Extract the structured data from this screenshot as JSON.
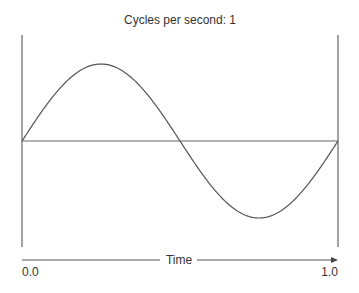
{
  "title": "Cycles per second: 1",
  "axis": {
    "label": "Time",
    "start_label": "0.0",
    "end_label": "1.0"
  },
  "chart_data": {
    "type": "line",
    "title": "Cycles per second: 1",
    "xlabel": "Time",
    "ylabel": "",
    "xlim": [
      0.0,
      1.0
    ],
    "ylim": [
      -1,
      1
    ],
    "cycles_per_second": 1,
    "waveform": "sine",
    "x_tick_labels": [
      "0.0",
      "1.0"
    ],
    "grid": false,
    "series": [
      {
        "name": "wave",
        "function": "sin(2*pi*1*t)",
        "x_range": [
          0.0,
          1.0
        ]
      }
    ]
  },
  "colors": {
    "line": "#555555",
    "text": "#333333"
  }
}
